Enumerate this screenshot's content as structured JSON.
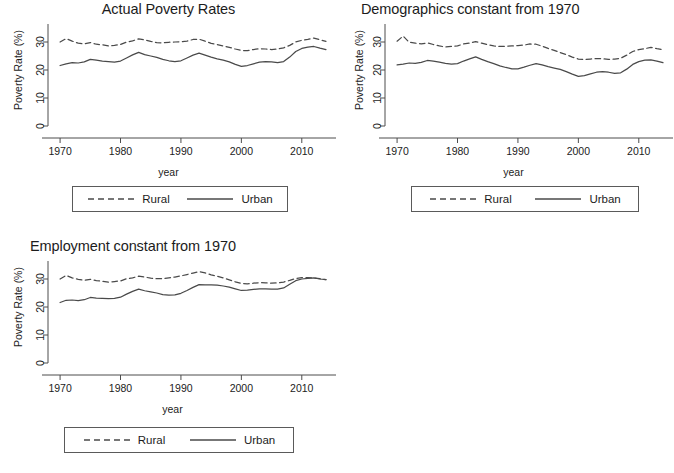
{
  "figure": {
    "background": "#ffffff",
    "line_color": "#4a4a4a",
    "axis_color": "#4d4d4d",
    "panel_count": 3
  },
  "panels": [
    {
      "title": "Actual Poverty Rates"
    },
    {
      "title": "Demographics constant from 1970"
    },
    {
      "title": "Employment constant from 1970"
    }
  ],
  "legend": {
    "rural_label": "Rural",
    "urban_label": "Urban",
    "rural_style": "dashed",
    "urban_style": "solid"
  },
  "axes": {
    "xlabel": "year",
    "ylabel": "Poverty Rate (%)",
    "xticks": [
      "1970",
      "1980",
      "1990",
      "2000",
      "2010"
    ],
    "yticks": [
      "0",
      "10",
      "20",
      "30"
    ],
    "xlim": [
      1968,
      2015
    ],
    "ylim": [
      0,
      35
    ]
  },
  "chart_data": [
    {
      "type": "line",
      "title": "Actual Poverty Rates",
      "xlabel": "year",
      "ylabel": "Poverty Rate (%)",
      "xlim": [
        1968,
        2015
      ],
      "ylim": [
        0,
        35
      ],
      "xticks": [
        1970,
        1980,
        1990,
        2000,
        2010
      ],
      "yticks": [
        0,
        10,
        20,
        30
      ],
      "grid": false,
      "legend_position": "below",
      "x": [
        1970,
        1971,
        1972,
        1973,
        1974,
        1975,
        1976,
        1977,
        1978,
        1979,
        1980,
        1981,
        1982,
        1983,
        1984,
        1985,
        1986,
        1987,
        1988,
        1989,
        1990,
        1991,
        1992,
        1993,
        1994,
        1995,
        1996,
        1997,
        1998,
        1999,
        2000,
        2001,
        2002,
        2003,
        2004,
        2005,
        2006,
        2007,
        2008,
        2009,
        2010,
        2011,
        2012,
        2013,
        2014
      ],
      "series": [
        {
          "name": "Rural",
          "style": "dashed",
          "values": [
            30.0,
            31.2,
            30.3,
            29.6,
            29.3,
            29.8,
            29.2,
            29.0,
            28.6,
            28.8,
            29.1,
            30.0,
            30.4,
            31.1,
            30.8,
            30.2,
            29.8,
            29.7,
            29.9,
            30.0,
            30.1,
            30.3,
            30.9,
            31.0,
            30.3,
            29.5,
            29.1,
            28.6,
            28.1,
            27.5,
            27.0,
            26.9,
            27.3,
            27.6,
            27.5,
            27.3,
            27.5,
            27.9,
            28.8,
            30.0,
            30.6,
            30.9,
            31.4,
            30.8,
            30.2
          ]
        },
        {
          "name": "Urban",
          "style": "solid",
          "values": [
            21.6,
            22.2,
            22.6,
            22.5,
            22.9,
            23.8,
            23.5,
            23.2,
            23.0,
            22.8,
            23.2,
            24.3,
            25.4,
            26.3,
            25.5,
            25.0,
            24.5,
            23.8,
            23.3,
            23.0,
            23.3,
            24.3,
            25.3,
            26.0,
            25.3,
            24.6,
            24.0,
            23.5,
            22.9,
            22.0,
            21.3,
            21.6,
            22.2,
            22.8,
            23.0,
            22.9,
            22.6,
            23.0,
            24.6,
            26.6,
            27.7,
            28.2,
            28.4,
            27.8,
            27.3
          ]
        }
      ]
    },
    {
      "type": "line",
      "title": "Demographics constant from 1970",
      "xlabel": "year",
      "ylabel": "Poverty Rate (%)",
      "xlim": [
        1968,
        2015
      ],
      "ylim": [
        0,
        35
      ],
      "xticks": [
        1970,
        1980,
        1990,
        2000,
        2010
      ],
      "yticks": [
        0,
        10,
        20,
        30
      ],
      "grid": false,
      "legend_position": "below",
      "x": [
        1970,
        1971,
        1972,
        1973,
        1974,
        1975,
        1976,
        1977,
        1978,
        1979,
        1980,
        1981,
        1982,
        1983,
        1984,
        1985,
        1986,
        1987,
        1988,
        1989,
        1990,
        1991,
        1992,
        1993,
        1994,
        1995,
        1996,
        1997,
        1998,
        1999,
        2000,
        2001,
        2002,
        2003,
        2004,
        2005,
        2006,
        2007,
        2008,
        2009,
        2010,
        2011,
        2012,
        2013,
        2014
      ],
      "series": [
        {
          "name": "Rural",
          "style": "dashed",
          "values": [
            30.3,
            32.1,
            29.9,
            29.6,
            29.3,
            29.7,
            29.1,
            28.6,
            28.2,
            28.4,
            28.6,
            29.3,
            29.6,
            30.1,
            29.6,
            29.0,
            28.6,
            28.4,
            28.5,
            28.6,
            28.7,
            28.9,
            29.3,
            29.2,
            28.5,
            27.7,
            27.0,
            26.2,
            25.5,
            24.6,
            23.9,
            23.7,
            23.9,
            24.1,
            24.0,
            23.8,
            23.9,
            24.2,
            25.3,
            26.6,
            27.3,
            27.6,
            28.1,
            27.6,
            27.3
          ]
        },
        {
          "name": "Urban",
          "style": "solid",
          "values": [
            21.8,
            22.1,
            22.5,
            22.4,
            22.7,
            23.4,
            23.2,
            22.8,
            22.4,
            22.1,
            22.3,
            23.2,
            24.0,
            24.7,
            23.8,
            23.0,
            22.3,
            21.5,
            20.9,
            20.4,
            20.4,
            21.0,
            21.7,
            22.3,
            21.8,
            21.2,
            20.7,
            20.2,
            19.4,
            18.5,
            17.7,
            18.0,
            18.6,
            19.2,
            19.4,
            19.2,
            18.8,
            19.0,
            20.3,
            22.0,
            23.0,
            23.5,
            23.6,
            23.2,
            22.6
          ]
        }
      ]
    },
    {
      "type": "line",
      "title": "Employment constant from 1970",
      "xlabel": "year",
      "ylabel": "Poverty Rate (%)",
      "xlim": [
        1968,
        2015
      ],
      "ylim": [
        0,
        35
      ],
      "xticks": [
        1970,
        1980,
        1990,
        2000,
        2010
      ],
      "yticks": [
        0,
        10,
        20,
        30
      ],
      "grid": false,
      "legend_position": "below",
      "x": [
        1970,
        1971,
        1972,
        1973,
        1974,
        1975,
        1976,
        1977,
        1978,
        1979,
        1980,
        1981,
        1982,
        1983,
        1984,
        1985,
        1986,
        1987,
        1988,
        1989,
        1990,
        1991,
        1992,
        1993,
        1994,
        1995,
        1996,
        1997,
        1998,
        1999,
        2000,
        2001,
        2002,
        2003,
        2004,
        2005,
        2006,
        2007,
        2008,
        2009,
        2010,
        2011,
        2012,
        2013,
        2014
      ],
      "series": [
        {
          "name": "Rural",
          "style": "dashed",
          "values": [
            30.0,
            31.3,
            30.4,
            29.9,
            29.5,
            29.9,
            29.4,
            29.2,
            28.9,
            29.1,
            29.3,
            30.1,
            30.4,
            31.0,
            30.7,
            30.3,
            30.1,
            30.1,
            30.4,
            30.7,
            31.1,
            31.6,
            32.1,
            32.6,
            32.2,
            31.5,
            31.0,
            30.4,
            29.7,
            29.0,
            28.4,
            28.3,
            28.5,
            28.7,
            28.6,
            28.5,
            28.6,
            28.9,
            29.5,
            30.2,
            30.5,
            30.5,
            30.4,
            30.1,
            29.8
          ]
        },
        {
          "name": "Urban",
          "style": "solid",
          "values": [
            21.6,
            22.4,
            22.5,
            22.3,
            22.6,
            23.4,
            23.2,
            23.1,
            23.0,
            23.1,
            23.5,
            24.6,
            25.6,
            26.4,
            25.8,
            25.4,
            25.0,
            24.4,
            24.2,
            24.3,
            24.9,
            25.9,
            27.0,
            28.0,
            27.9,
            27.9,
            27.8,
            27.5,
            27.1,
            26.5,
            25.9,
            26.0,
            26.3,
            26.5,
            26.5,
            26.4,
            26.4,
            26.8,
            28.1,
            29.4,
            30.0,
            30.2,
            30.4,
            30.0,
            29.8
          ]
        }
      ]
    }
  ]
}
